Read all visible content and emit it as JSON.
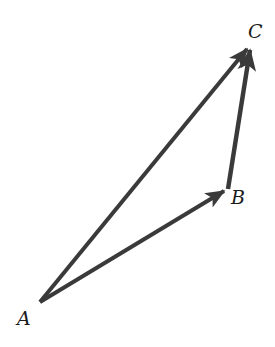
{
  "diagram": {
    "type": "vector-triangle",
    "points": {
      "A": {
        "label": "A",
        "x": 40,
        "y": 302
      },
      "B": {
        "label": "B",
        "x": 228,
        "y": 189
      },
      "C": {
        "label": "C",
        "x": 251,
        "y": 44
      }
    },
    "vectors": [
      {
        "from": "A",
        "to": "B"
      },
      {
        "from": "B",
        "to": "C"
      },
      {
        "from": "A",
        "to": "C"
      }
    ],
    "stroke_color": "#3a3a3a"
  }
}
